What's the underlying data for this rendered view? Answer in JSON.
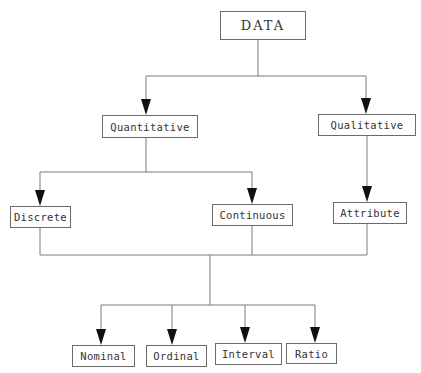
{
  "diagram": {
    "type": "tree",
    "line_color": "#7a7a7a",
    "arrow_color": "#111111",
    "nodes": {
      "data": {
        "label": "DATA",
        "x": 220,
        "y": 11,
        "w": 86,
        "h": 29
      },
      "quantitative": {
        "label": "Quantitative",
        "x": 102,
        "y": 115,
        "w": 96,
        "h": 23
      },
      "qualitative": {
        "label": "Qualitative",
        "x": 318,
        "y": 114,
        "w": 98,
        "h": 22
      },
      "discrete": {
        "label": "Discrete",
        "x": 10,
        "y": 206,
        "w": 61,
        "h": 22
      },
      "continuous": {
        "label": "Continuous",
        "x": 212,
        "y": 204,
        "w": 81,
        "h": 22
      },
      "attribute": {
        "label": "Attribute",
        "x": 333,
        "y": 202,
        "w": 74,
        "h": 22
      },
      "nominal": {
        "label": "Nominal",
        "x": 72,
        "y": 345,
        "w": 63,
        "h": 22
      },
      "ordinal": {
        "label": "Ordinal",
        "x": 146,
        "y": 345,
        "w": 61,
        "h": 22
      },
      "interval": {
        "label": "Interval",
        "x": 215,
        "y": 343,
        "w": 67,
        "h": 22
      },
      "ratio": {
        "label": "Ratio",
        "x": 286,
        "y": 343,
        "w": 51,
        "h": 21
      }
    },
    "edges": [
      {
        "from": "DATA",
        "to": [
          "Quantitative",
          "Qualitative"
        ]
      },
      {
        "from": "Quantitative",
        "to": [
          "Discrete",
          "Continuous"
        ]
      },
      {
        "from": "Qualitative",
        "to": [
          "Attribute"
        ]
      },
      {
        "from": [
          "Discrete",
          "Continuous",
          "Attribute"
        ],
        "to": [
          "Nominal",
          "Ordinal",
          "Interval",
          "Ratio"
        ]
      }
    ]
  }
}
